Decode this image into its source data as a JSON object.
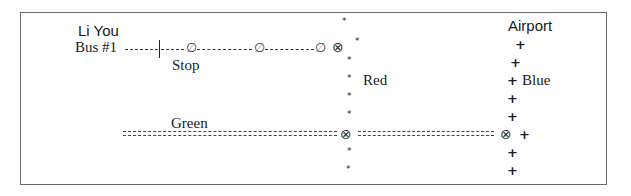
{
  "diagram": {
    "rider_name": "Li You",
    "bus_label": "Bus #1",
    "stop_label": "Stop",
    "lines": {
      "red": {
        "label": "Red",
        "marker": "*"
      },
      "blue": {
        "label": "Blue",
        "marker": "+",
        "terminus": "Airport"
      },
      "green": {
        "label": "Green",
        "marker": "="
      }
    },
    "symbols": {
      "bus_stop": "∅",
      "interchange": "⊗",
      "star": "*",
      "plus": "+"
    }
  }
}
